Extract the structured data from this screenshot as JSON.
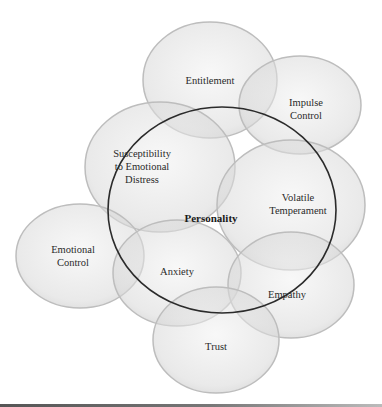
{
  "diagram": {
    "type": "overlapping-circles",
    "center": {
      "label": "Personality",
      "cx": 222,
      "cy": 210,
      "rx": 114,
      "ry": 103,
      "stroke": "#2b2b2b"
    },
    "circles": [
      {
        "id": "entitlement",
        "label_lines": [
          "Entitlement"
        ],
        "cx": 210,
        "cy": 80,
        "rx": 67,
        "ry": 58
      },
      {
        "id": "impulse-control",
        "label_lines": [
          "Impulse",
          "Control"
        ],
        "cx": 300,
        "cy": 105,
        "rx": 61,
        "ry": 49
      },
      {
        "id": "susceptibility",
        "label_lines": [
          "Susceptibility",
          "to Emotional",
          "Distress"
        ],
        "cx": 160,
        "cy": 167,
        "rx": 75,
        "ry": 65
      },
      {
        "id": "volatile-temperament",
        "label_lines": [
          "Volatile",
          "Temperament"
        ],
        "cx": 291,
        "cy": 205,
        "rx": 74,
        "ry": 65
      },
      {
        "id": "emotional-control",
        "label_lines": [
          "Emotional",
          "Control"
        ],
        "cx": 80,
        "cy": 256,
        "rx": 64,
        "ry": 52
      },
      {
        "id": "anxiety",
        "label_lines": [
          "Anxiety"
        ],
        "cx": 177,
        "cy": 273,
        "rx": 64,
        "ry": 53
      },
      {
        "id": "empathy",
        "label_lines": [
          "Empathy"
        ],
        "cx": 291,
        "cy": 285,
        "rx": 63,
        "ry": 53
      },
      {
        "id": "trust",
        "label_lines": [
          "Trust"
        ],
        "cx": 216,
        "cy": 340,
        "rx": 63,
        "ry": 53
      }
    ],
    "colors": {
      "circle_fill": "#d9d9d9",
      "circle_stroke": "#bdbdbd",
      "center_stroke": "#2b2b2b",
      "text": "#2a2a2a"
    }
  },
  "labels": {
    "center": "Personality",
    "entitlement": "Entitlement",
    "impulse_1": "Impulse",
    "impulse_2": "Control",
    "susc_1": "Susceptibility",
    "susc_2": "to Emotional",
    "susc_3": "Distress",
    "volatile_1": "Volatile",
    "volatile_2": "Temperament",
    "emo_1": "Emotional",
    "emo_2": "Control",
    "anxiety": "Anxiety",
    "empathy": "Empathy",
    "trust": "Trust"
  }
}
